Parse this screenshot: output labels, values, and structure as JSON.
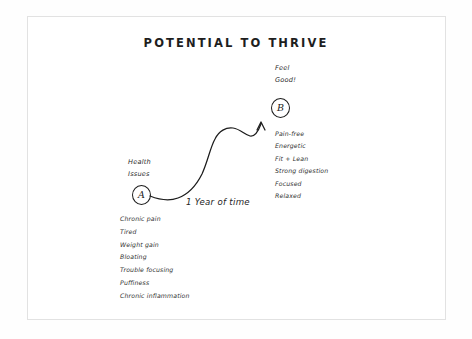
{
  "title": "POTENTIAL TO THRIVE",
  "point_a": {
    "marker": "A",
    "label_line1": "Health",
    "label_line2": "Issues",
    "symptoms": [
      "Chronic pain",
      "Tired",
      "Weight gain",
      "Bloating",
      "Trouble focusing",
      "Puffiness",
      "Chronic inflammation"
    ]
  },
  "point_b": {
    "marker": "B",
    "label_line1": "Feel",
    "label_line2": "Good!",
    "benefits": [
      "Pain-free",
      "Energetic",
      "Fit + Lean",
      "Strong digestion",
      "Focused",
      "Relaxed"
    ]
  },
  "curve": {
    "time_label": "1 Year of time",
    "stroke_color": "#1c1c1c"
  },
  "frame": {
    "border_color": "#e2e2e2"
  }
}
